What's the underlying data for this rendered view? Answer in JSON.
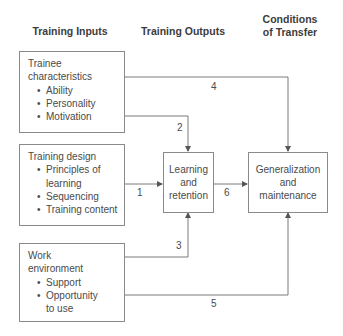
{
  "headers": {
    "inputs": "Training Inputs",
    "outputs": "Training Outputs",
    "conditions_line1": "Conditions",
    "conditions_line2": "of Transfer"
  },
  "inputs": [
    {
      "title_line1": "Trainee",
      "title_line2": "characteristics",
      "items": [
        "Ability",
        "Personality",
        "Motivation"
      ]
    },
    {
      "title_line1": "Training design",
      "items": [
        "Principles of",
        "learning",
        "Sequencing",
        "Training content"
      ]
    },
    {
      "title_line1": "Work",
      "title_line2": "environment",
      "items": [
        "Support",
        "Opportunity",
        "to use"
      ]
    }
  ],
  "outputs": {
    "learning": [
      "Learning",
      "and",
      "retention"
    ],
    "generalization": [
      "Generalization",
      "and",
      "maintenance"
    ]
  },
  "arrow_labels": {
    "a1": "1",
    "a2": "2",
    "a3": "3",
    "a4": "4",
    "a5": "5",
    "a6": "6"
  },
  "colors": {
    "line": "#7a7a7a",
    "text": "#4a4a4a",
    "border": "#8a8a8a"
  }
}
